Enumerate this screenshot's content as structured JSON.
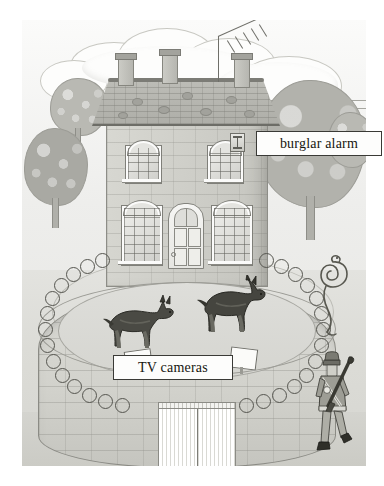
{
  "illustration": {
    "title": "Secured house illustration",
    "description": "Pencil and wash drawing of a two-storey stone house protected by a circular wall topped with razor wire, guard dogs, TV cameras, a burglar alarm and an armed guard.",
    "style": "grayscale-pencil-illustration"
  },
  "callouts": [
    {
      "id": "burglar-alarm",
      "label": "burglar alarm",
      "points_to": "alarm-box-on-house-wall"
    },
    {
      "id": "tv-cameras",
      "label": "TV cameras",
      "points_to": "cameras-on-perimeter-wall"
    }
  ],
  "scene_elements": {
    "house": {
      "name": "house",
      "storeys": 2,
      "windows": 4,
      "doors": 1,
      "chimneys": 3,
      "antenna": "TV aerial"
    },
    "security": {
      "burglar_alarm": 1,
      "tv_cameras": 2,
      "guard_dogs": 2,
      "razor_wire": "perimeter wall top",
      "armed_guard": 1,
      "snake": 1,
      "gate": "double white gate"
    },
    "landscape": {
      "trees": 4,
      "clouds": 5,
      "telegraph_poles": 2
    }
  },
  "colors": {
    "paper": "#ffffff",
    "ink": "#16160f",
    "wash_light": "#e3e3df",
    "wash_mid": "#c4c4be",
    "wash_dark": "#8b8b85",
    "label_fill": "#fdfdfc",
    "label_border": "#3a3a36"
  }
}
